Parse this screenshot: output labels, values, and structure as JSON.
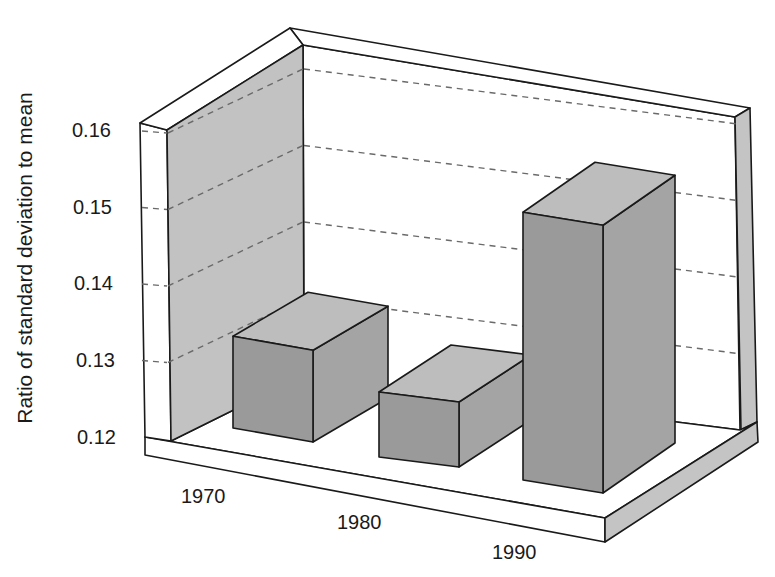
{
  "chart_data": {
    "type": "bar",
    "style": "3d",
    "title": "",
    "xlabel": "",
    "ylabel": "Ratio of standard deviation to mean",
    "categories": [
      "1970",
      "1980",
      "1990"
    ],
    "values": [
      0.132,
      0.1285,
      0.155
    ],
    "ylim": [
      0.12,
      0.16
    ],
    "yticks": [
      "0.12",
      "0.13",
      "0.14",
      "0.15",
      "0.16"
    ],
    "grid": true,
    "legend": null
  },
  "colors": {
    "bar_front": "#9a9a9a",
    "bar_side": "#a4a4a4",
    "bar_top": "#bdbdbd",
    "left_wall_inner": "#c2c2c2",
    "wall_cap": "#ffffff",
    "floor": "#ffffff",
    "floor_side": "#c4c4c4",
    "right_wall_edge": "#c4c4c4",
    "edge": "#1a1a1a",
    "grid": "#6a6a6a"
  },
  "layout": {
    "ytick_positions": [
      {
        "label": "0.16",
        "x": 72,
        "y": 130
      },
      {
        "label": "0.15",
        "x": 73,
        "y": 207
      },
      {
        "label": "0.14",
        "x": 74,
        "y": 283
      },
      {
        "label": "0.13",
        "x": 76,
        "y": 360
      },
      {
        "label": "0.12",
        "x": 77,
        "y": 437
      }
    ],
    "xtick_positions": [
      {
        "label": "1970",
        "x": 181,
        "y": 485
      },
      {
        "label": "1980",
        "x": 337,
        "y": 511
      },
      {
        "label": "1990",
        "x": 492,
        "y": 541
      }
    ]
  }
}
